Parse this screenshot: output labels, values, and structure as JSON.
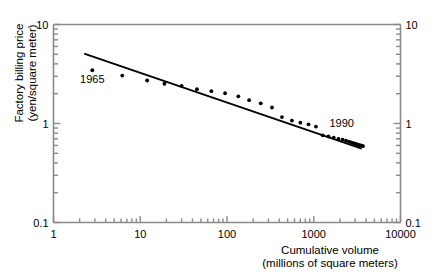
{
  "chart_data": {
    "type": "scatter",
    "title": "",
    "xlabel": "Cumulative volume (millions of square meters)",
    "xlabel_line1": "Cumulative volume",
    "xlabel_line2": "(millions of square meters)",
    "ylabel": "Factory billing price (yen/square meter)",
    "ylabel_line1": "Factory billing price",
    "ylabel_line2": "(yen/square meter)",
    "xscale": "log",
    "yscale": "log",
    "xlim": [
      1,
      10000
    ],
    "ylim": [
      0.1,
      10
    ],
    "grid": false,
    "legend": null,
    "xticks": [
      "1",
      "10",
      "100",
      "1000",
      "10000"
    ],
    "yticks": [
      "0.1",
      "1",
      "10"
    ],
    "yticks_right": [
      "0.1",
      "1",
      "10"
    ],
    "minor_ticks": true,
    "marker": "filled-circle",
    "marker_color": "#000000",
    "line_color": "#000000",
    "annotations": [
      {
        "text": "1965",
        "x": 2.8,
        "y": 2.55
      },
      {
        "text": "1990",
        "x": 2100,
        "y": 0.93
      }
    ],
    "trendline": {
      "label": "fitted experience curve",
      "x": [
        2.3,
        3500
      ],
      "y": [
        5.05,
        0.56
      ]
    },
    "points": [
      {
        "x": 2.8,
        "y": 3.45
      },
      {
        "x": 6.2,
        "y": 3.05
      },
      {
        "x": 12.0,
        "y": 2.72
      },
      {
        "x": 19.0,
        "y": 2.52
      },
      {
        "x": 30.0,
        "y": 2.4
      },
      {
        "x": 45.0,
        "y": 2.22
      },
      {
        "x": 66.0,
        "y": 2.12
      },
      {
        "x": 95.0,
        "y": 2.02
      },
      {
        "x": 135.0,
        "y": 1.88
      },
      {
        "x": 180.0,
        "y": 1.72
      },
      {
        "x": 245.0,
        "y": 1.6
      },
      {
        "x": 330.0,
        "y": 1.45
      },
      {
        "x": 430.0,
        "y": 1.16
      },
      {
        "x": 560.0,
        "y": 1.07
      },
      {
        "x": 700.0,
        "y": 1.02
      },
      {
        "x": 870.0,
        "y": 0.98
      },
      {
        "x": 1060.0,
        "y": 0.93
      },
      {
        "x": 1270.0,
        "y": 0.76
      },
      {
        "x": 1480.0,
        "y": 0.74
      },
      {
        "x": 1700.0,
        "y": 0.72
      },
      {
        "x": 1930.0,
        "y": 0.7
      },
      {
        "x": 2150.0,
        "y": 0.685
      },
      {
        "x": 2350.0,
        "y": 0.67
      },
      {
        "x": 2540.0,
        "y": 0.655
      },
      {
        "x": 2700.0,
        "y": 0.645
      },
      {
        "x": 2850.0,
        "y": 0.635
      },
      {
        "x": 2980.0,
        "y": 0.625
      },
      {
        "x": 3100.0,
        "y": 0.618
      },
      {
        "x": 3220.0,
        "y": 0.612
      },
      {
        "x": 3340.0,
        "y": 0.606
      },
      {
        "x": 3460.0,
        "y": 0.6
      },
      {
        "x": 3580.0,
        "y": 0.596
      },
      {
        "x": 3700.0,
        "y": 0.592
      }
    ]
  }
}
